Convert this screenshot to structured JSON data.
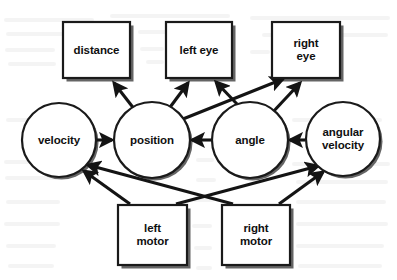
{
  "diagram": {
    "background_color": "#ffffff",
    "stroke_color": "#141414",
    "node_fill": "#ffffff",
    "shadow_color": "#4a4a4a",
    "nodes": [
      {
        "id": "distance",
        "label": "distance",
        "shape": "rect",
        "x": 63,
        "y": 22,
        "w": 67,
        "h": 56
      },
      {
        "id": "left_eye",
        "label": "left eye",
        "shape": "rect",
        "x": 166,
        "y": 22,
        "w": 66,
        "h": 56
      },
      {
        "id": "right_eye",
        "label": "right\neye",
        "shape": "rect",
        "x": 272,
        "y": 22,
        "w": 68,
        "h": 56
      },
      {
        "id": "velocity",
        "label": "velocity",
        "shape": "circle",
        "cx": 59,
        "cy": 140,
        "r": 37
      },
      {
        "id": "position",
        "label": "position",
        "shape": "circle",
        "cx": 152,
        "cy": 140,
        "r": 38
      },
      {
        "id": "angle",
        "label": "angle",
        "shape": "circle",
        "cx": 250,
        "cy": 140,
        "r": 38
      },
      {
        "id": "angular_velocity",
        "label": "angular\nvelocity",
        "shape": "circle",
        "cx": 343,
        "cy": 139,
        "r": 37
      },
      {
        "id": "left_motor",
        "label": "left\nmotor",
        "shape": "rect",
        "x": 118,
        "y": 205,
        "w": 69,
        "h": 60
      },
      {
        "id": "right_motor",
        "label": "right\nmotor",
        "shape": "rect",
        "x": 222,
        "y": 205,
        "w": 68,
        "h": 60
      }
    ],
    "edges": [
      {
        "from": "position",
        "to": "distance",
        "x1": 135,
        "y1": 110,
        "x2": 114,
        "y2": 83
      },
      {
        "from": "position",
        "to": "left_eye",
        "x1": 168,
        "y1": 110,
        "x2": 188,
        "y2": 83
      },
      {
        "from": "position",
        "to": "right_eye",
        "x1": 178,
        "y1": 121,
        "x2": 283,
        "y2": 79
      },
      {
        "from": "angle",
        "to": "left_eye",
        "x1": 237,
        "y1": 104,
        "x2": 216,
        "y2": 82
      },
      {
        "from": "angle",
        "to": "right_eye",
        "x1": 272,
        "y1": 113,
        "x2": 300,
        "y2": 83
      },
      {
        "from": "velocity",
        "to": "position",
        "x1": 97,
        "y1": 140,
        "x2": 112,
        "y2": 140
      },
      {
        "from": "angle",
        "to": "position",
        "x1": 211,
        "y1": 140,
        "x2": 192,
        "y2": 140
      },
      {
        "from": "angular_velocity",
        "to": "angle",
        "x1": 305,
        "y1": 140,
        "x2": 290,
        "y2": 140
      },
      {
        "from": "left_motor",
        "to": "velocity",
        "x1": 130,
        "y1": 204,
        "x2": 84,
        "y2": 171
      },
      {
        "from": "right_motor",
        "to": "velocity",
        "x1": 233,
        "y1": 204,
        "x2": 88,
        "y2": 165
      },
      {
        "from": "left_motor",
        "to": "angular_velocity",
        "x1": 176,
        "y1": 204,
        "x2": 318,
        "y2": 166
      },
      {
        "from": "right_motor",
        "to": "angular_velocity",
        "x1": 279,
        "y1": 204,
        "x2": 323,
        "y2": 172
      }
    ]
  }
}
